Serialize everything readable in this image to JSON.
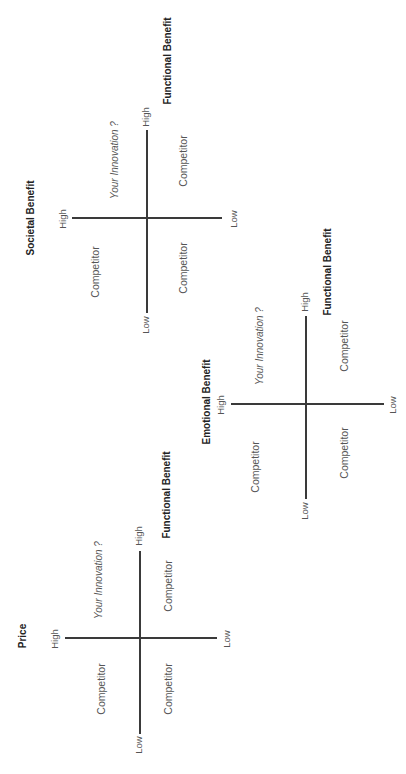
{
  "diagrams": [
    {
      "y_axis_title": "Societal Benefit",
      "x_axis_title": "Functional Benefit",
      "y_high": "High",
      "y_low": "Low",
      "x_high": "High",
      "x_low": "Low",
      "quadrants": {
        "high_high": "Your Innovation ?",
        "low_high": "Competitor",
        "high_low": "Competitor",
        "low_low": "Competitor"
      }
    },
    {
      "y_axis_title": "Emotional  Benefit",
      "x_axis_title": "Functional  Benefit",
      "y_high": "High",
      "y_low": "Low",
      "x_high": "High",
      "x_low": "Low",
      "quadrants": {
        "high_high": "Your Innovation ?",
        "low_high": "Competitor",
        "high_low": "Competitor",
        "low_low": "Competitor"
      }
    },
    {
      "y_axis_title": "Price",
      "x_axis_title": "Functional  Benefit",
      "y_high": "High",
      "y_low": "Low",
      "x_high": "High",
      "x_low": "Low",
      "quadrants": {
        "high_high": "Your Innovation ?",
        "low_high": "Competitor",
        "high_low": "Competitor",
        "low_low": "Competitor"
      }
    }
  ],
  "colors": {
    "axis": "#3a3a3a",
    "text": "#555555",
    "title": "#222222"
  }
}
